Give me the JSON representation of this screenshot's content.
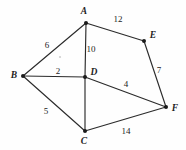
{
  "figure": {
    "background_color": "#fefefe",
    "edge_color": "#2b2b2b",
    "vertex_color": "#1a1a1a",
    "text_color": "#1c1c1c",
    "width": 186,
    "height": 150
  },
  "chart_data": {
    "type": "diagram",
    "subtype": "weighted-undirected-graph",
    "title": "",
    "nodes": [
      {
        "id": "A",
        "label": "A",
        "x": 86,
        "y": 23,
        "label_x": 84,
        "label_y": 12
      },
      {
        "id": "B",
        "label": "B",
        "x": 23,
        "y": 76,
        "label_x": 14,
        "label_y": 76
      },
      {
        "id": "C",
        "label": "C",
        "x": 85,
        "y": 131,
        "label_x": 84,
        "label_y": 142
      },
      {
        "id": "D",
        "label": "D",
        "x": 85,
        "y": 77,
        "label_x": 94,
        "label_y": 73
      },
      {
        "id": "E",
        "label": "E",
        "x": 144,
        "y": 41,
        "label_x": 153,
        "label_y": 36
      },
      {
        "id": "F",
        "label": "F",
        "x": 166,
        "y": 107,
        "label_x": 175,
        "label_y": 109
      }
    ],
    "edges": [
      {
        "from": "A",
        "to": "B",
        "weight": "6",
        "label_x": 47,
        "label_y": 45
      },
      {
        "from": "A",
        "to": "D",
        "weight": "10",
        "label_x": 91,
        "label_y": 49
      },
      {
        "from": "A",
        "to": "E",
        "weight": "12",
        "label_x": 118,
        "label_y": 19
      },
      {
        "from": "B",
        "to": "D",
        "weight": "2",
        "label_x": 58,
        "label_y": 71
      },
      {
        "from": "B",
        "to": "C",
        "weight": "5",
        "label_x": 46,
        "label_y": 111
      },
      {
        "from": "D",
        "to": "C",
        "weight": "",
        "label_x": 0,
        "label_y": 0
      },
      {
        "from": "D",
        "to": "F",
        "weight": "4",
        "label_x": 126,
        "label_y": 84
      },
      {
        "from": "E",
        "to": "F",
        "weight": "7",
        "label_x": 159,
        "label_y": 70
      },
      {
        "from": "C",
        "to": "F",
        "weight": "14",
        "label_x": 126,
        "label_y": 131
      }
    ],
    "legend": [],
    "xlabel": "",
    "ylabel": ""
  }
}
